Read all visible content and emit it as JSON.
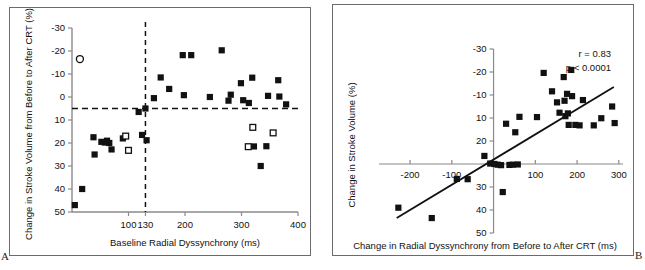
{
  "figure": {
    "panel_a_letter": "A",
    "panel_b_letter": "B"
  },
  "panel_a": {
    "xlabel": "Baseline Radial Dyssynchrony (ms)",
    "ylabel": "Change in Stroke Volume from Before to After CRT (%)",
    "xticks": [
      "100",
      "130",
      "200",
      "300",
      "400"
    ],
    "yticks": [
      "50",
      "40",
      "30",
      "20",
      "10",
      "0",
      "-10",
      "-20",
      "-30"
    ]
  },
  "panel_b": {
    "xlabel": "Change in Radial Dyssynchrony from Before to After CRT (ms)",
    "ylabel": "Change in Stroke Volume (%)",
    "xticks": [
      "-200",
      "-100",
      "100",
      "200",
      "300"
    ],
    "yticks": [
      "50",
      "40",
      "30",
      "20",
      "10",
      "-10",
      "-20",
      "-30"
    ],
    "stat_r": "r = 0.83",
    "stat_p": "p < 0.0001"
  },
  "chart_data": [
    {
      "type": "scatter",
      "panel": "A",
      "title": "",
      "xlabel": "Baseline Radial Dyssynchrony (ms)",
      "ylabel": "Change in Stroke Volume from Before to After CRT (%)",
      "xlim": [
        0,
        400
      ],
      "ylim": [
        -30,
        50
      ],
      "xticks": [
        100,
        130,
        200,
        300,
        400
      ],
      "yticks": [
        -30,
        -20,
        -10,
        0,
        10,
        20,
        30,
        40,
        50
      ],
      "grid": false,
      "legend": null,
      "reference_lines": [
        {
          "orientation": "horizontal",
          "value": 15,
          "style": "dashed"
        },
        {
          "orientation": "vertical",
          "value": 130,
          "style": "dashed"
        }
      ],
      "series": [
        {
          "name": "filled-square",
          "marker": "filled-square",
          "points": [
            [
              5,
              -27
            ],
            [
              18,
              -20
            ],
            [
              38,
              2.5
            ],
            [
              40,
              -5
            ],
            [
              52,
              0.5
            ],
            [
              58,
              0.2
            ],
            [
              62,
              1.0
            ],
            [
              66,
              0.0
            ],
            [
              70,
              -2.8
            ],
            [
              90,
              2.0
            ],
            [
              118,
              13.5
            ],
            [
              124,
              3.5
            ],
            [
              130,
              15.0
            ],
            [
              132,
              1.2
            ],
            [
              145,
              19.5
            ],
            [
              157,
              28.5
            ],
            [
              172,
              23.5
            ],
            [
              196,
              38.2
            ],
            [
              198,
              20.8
            ],
            [
              211,
              38.2
            ],
            [
              244,
              20.0
            ],
            [
              265,
              40.3
            ],
            [
              277,
              18.4
            ],
            [
              281,
              21.0
            ],
            [
              299,
              26.0
            ],
            [
              303,
              18.6
            ],
            [
              313,
              17.4
            ],
            [
              319,
              28.4
            ],
            [
              322,
              -1.5
            ],
            [
              334,
              -10.0
            ],
            [
              344,
              -1.4
            ],
            [
              347,
              20.5
            ],
            [
              365,
              27.3
            ],
            [
              367,
              20.2
            ],
            [
              379,
              16.8
            ]
          ]
        },
        {
          "name": "open-square",
          "marker": "open-square",
          "points": [
            [
              95,
              3.0
            ],
            [
              100,
              -3.2
            ],
            [
              312,
              -1.6
            ],
            [
              320,
              6.8
            ],
            [
              356,
              4.4
            ]
          ]
        },
        {
          "name": "open-circle",
          "marker": "open-circle",
          "points": [
            [
              14,
              36.5
            ]
          ]
        }
      ]
    },
    {
      "type": "scatter",
      "panel": "B",
      "title": "",
      "xlabel": "Change in Radial Dyssynchrony from Before to After CRT (ms)",
      "ylabel": "Change in Stroke Volume (%)",
      "xlim": [
        -260,
        310
      ],
      "ylim": [
        -30,
        50
      ],
      "xticks": [
        -200,
        -100,
        100,
        200,
        300
      ],
      "yticks": [
        -30,
        -20,
        -10,
        10,
        20,
        30,
        40,
        50
      ],
      "grid": false,
      "legend": null,
      "annotations": [
        "r = 0.83",
        "p < 0.0001"
      ],
      "trendline": {
        "x": [
          -232,
          288
        ],
        "y": [
          -23.5,
          33.5
        ]
      },
      "series": [
        {
          "name": "filled-square",
          "marker": "filled-square",
          "points": [
            [
              -228,
              -19.0
            ],
            [
              -148,
              -23.5
            ],
            [
              -88,
              -6.5
            ],
            [
              -62,
              -6.6
            ],
            [
              -22,
              3.5
            ],
            [
              -8,
              0.2
            ],
            [
              2,
              0.0
            ],
            [
              10,
              -0.3
            ],
            [
              18,
              -0.5
            ],
            [
              22,
              -12.2
            ],
            [
              30,
              17.5
            ],
            [
              38,
              -0.4
            ],
            [
              46,
              -0.3
            ],
            [
              52,
              13.8
            ],
            [
              58,
              -0.2
            ],
            [
              62,
              20.5
            ],
            [
              104,
              20.4
            ],
            [
              120,
              39.6
            ],
            [
              140,
              31.6
            ],
            [
              152,
              26.8
            ],
            [
              158,
              22.3
            ],
            [
              168,
              37.8
            ],
            [
              170,
              27.5
            ],
            [
              172,
              20.8
            ],
            [
              176,
              30.5
            ],
            [
              178,
              22.0
            ],
            [
              180,
              17.0
            ],
            [
              186,
              40.9
            ],
            [
              188,
              29.5
            ],
            [
              196,
              17.0
            ],
            [
              206,
              16.8
            ],
            [
              214,
              27.8
            ],
            [
              240,
              16.8
            ],
            [
              258,
              19.9
            ],
            [
              284,
              25.0
            ],
            [
              290,
              17.8
            ]
          ]
        }
      ]
    }
  ]
}
